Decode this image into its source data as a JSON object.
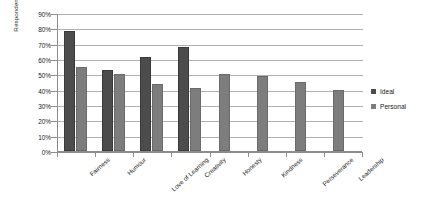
{
  "chart_data": {
    "type": "bar",
    "title": "",
    "subtitle": "",
    "xlabel": "",
    "ylabel": "Respondents (%)",
    "ylim": [
      0,
      90
    ],
    "ytick_step": 10,
    "ytick_labels": [
      "0%",
      "10%",
      "20%",
      "30%",
      "40%",
      "50%",
      "60%",
      "70%",
      "80%",
      "90%"
    ],
    "grid": true,
    "legend_position": "right",
    "categories": [
      "Fairness",
      "Humour",
      "Love of Learning",
      "Creativity",
      "Honesty",
      "Kindness",
      "Perseverance",
      "Leadership"
    ],
    "series": [
      {
        "name": "Ideal",
        "color": "#4c4c4c",
        "values": [
          78,
          53,
          61,
          68,
          null,
          null,
          null,
          null
        ]
      },
      {
        "name": "Personal",
        "color": "#7d7d7d",
        "values": [
          55,
          50,
          44,
          41,
          50,
          49,
          45,
          40
        ]
      }
    ]
  },
  "legend": {
    "items": [
      {
        "label": "Ideal"
      },
      {
        "label": "Personal"
      }
    ]
  },
  "axis": {
    "y_title": "Respondents (%)"
  },
  "colors": {
    "ideal": "#4c4c4c",
    "personal": "#7d7d7d",
    "gridline": "#b0b0b0",
    "axis": "#8c8c8c",
    "background": "#ffffff"
  }
}
